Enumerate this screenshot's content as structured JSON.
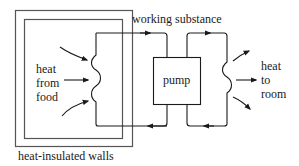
{
  "diagram": {
    "labels": {
      "working_substance": "working substance",
      "pump": "pump",
      "heat_from_food": [
        "heat",
        "from",
        "food"
      ],
      "heat_to_room": [
        "heat",
        "to",
        "room"
      ],
      "walls": "heat-insulated walls"
    },
    "colors": {
      "line": "#1a1a1a",
      "wall": "#555555",
      "background": "#ffffff"
    }
  }
}
